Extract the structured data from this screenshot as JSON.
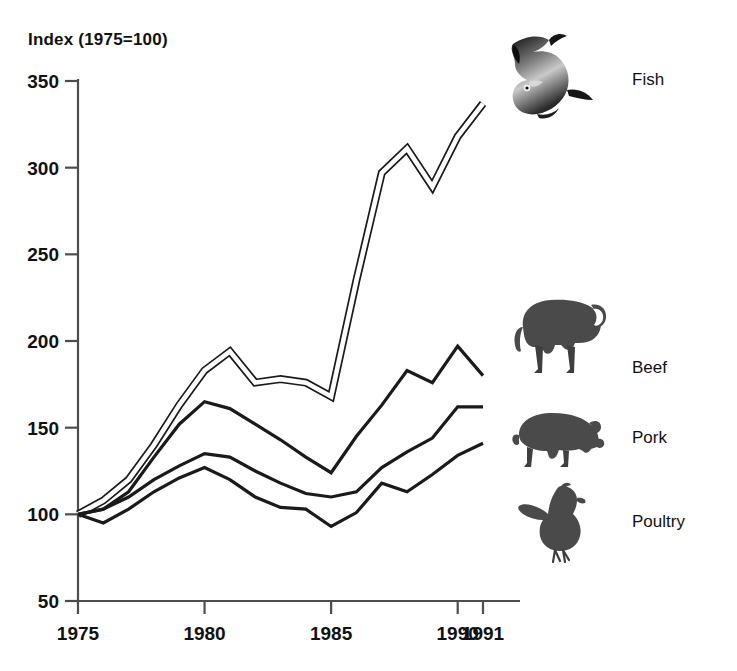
{
  "chart_data": {
    "type": "line",
    "title": "Index (1975=100)",
    "xlabel": "",
    "ylabel": "Index (1975=100)",
    "xlim": [
      1975,
      1991
    ],
    "ylim": [
      50,
      350
    ],
    "ytick_labels": [
      "50",
      "100",
      "150",
      "200",
      "250",
      "300",
      "350"
    ],
    "yticks": [
      50,
      100,
      150,
      200,
      250,
      300,
      350
    ],
    "xtick_labels": [
      "1975",
      "1980",
      "1985",
      "1990",
      "1991"
    ],
    "xticks": [
      1975,
      1980,
      1985,
      1990,
      1991
    ],
    "grid": false,
    "legend_position": "right",
    "x": [
      1975,
      1976,
      1977,
      1978,
      1979,
      1980,
      1981,
      1982,
      1983,
      1984,
      1985,
      1986,
      1987,
      1988,
      1989,
      1990,
      1991
    ],
    "series": [
      {
        "name": "Fish",
        "style": "double-line",
        "color": "#1a1a1a",
        "values": [
          100,
          108,
          120,
          140,
          163,
          183,
          194,
          176,
          178,
          176,
          168,
          235,
          297,
          311,
          289,
          318,
          337
        ]
      },
      {
        "name": "Beef",
        "style": "solid",
        "color": "#1a1a1a",
        "values": [
          100,
          103,
          113,
          133,
          152,
          165,
          161,
          152,
          143,
          133,
          124,
          145,
          163,
          183,
          176,
          197,
          180
        ]
      },
      {
        "name": "Pork",
        "style": "solid",
        "color": "#1a1a1a",
        "values": [
          100,
          103,
          110,
          120,
          128,
          135,
          133,
          125,
          118,
          112,
          110,
          113,
          127,
          136,
          144,
          162,
          162
        ]
      },
      {
        "name": "Poultry",
        "style": "solid",
        "color": "#1a1a1a",
        "values": [
          100,
          95,
          103,
          113,
          121,
          127,
          120,
          110,
          104,
          103,
          93,
          101,
          118,
          113,
          123,
          134,
          141
        ]
      }
    ]
  },
  "legend": {
    "items": [
      {
        "label": "Fish",
        "icon": "fish-icon"
      },
      {
        "label": "Beef",
        "icon": "bull-icon"
      },
      {
        "label": "Pork",
        "icon": "pig-icon"
      },
      {
        "label": "Poultry",
        "icon": "chicken-icon"
      }
    ]
  },
  "colors": {
    "ink": "#1a1a1a",
    "axis": "#4d4d4d",
    "background": "#ffffff"
  }
}
